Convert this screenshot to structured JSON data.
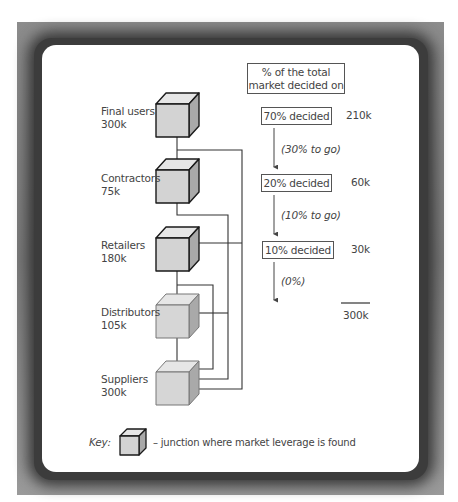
{
  "diagram": {
    "header_box": "% of the total market decided on",
    "header_box_lines": [
      "% of the total",
      "market decided on"
    ],
    "nodes": [
      {
        "id": "final-users",
        "name": "Final users",
        "value": "300k",
        "leverage": true
      },
      {
        "id": "contractors",
        "name": "Contractors",
        "value": "75k",
        "leverage": true
      },
      {
        "id": "retailers",
        "name": "Retailers",
        "value": "180k",
        "leverage": true
      },
      {
        "id": "distributors",
        "name": "Distributors",
        "value": "105k",
        "leverage": false
      },
      {
        "id": "suppliers",
        "name": "Suppliers",
        "value": "300k",
        "leverage": false
      }
    ],
    "decisions": [
      {
        "label": "70% decided",
        "amount": "210k"
      },
      {
        "label": "20% decided",
        "amount": "60k"
      },
      {
        "label": "10% decided",
        "amount": "30k"
      }
    ],
    "remaining": [
      "(30% to go)",
      "(10% to go)",
      "(0%)"
    ],
    "total": "300k",
    "key": {
      "label": "Key:",
      "description": "– junction where market leverage is found"
    },
    "colors": {
      "cube_front": "#d3d3d3",
      "cube_top": "#e6e6e6",
      "cube_side": "#a9a9a9",
      "frame": "#858585"
    }
  }
}
